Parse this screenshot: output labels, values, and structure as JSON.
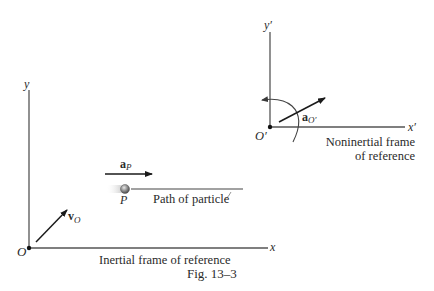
{
  "inertial_frame": {
    "origin_label": "O",
    "x_axis_label": "x",
    "y_axis_label": "y",
    "caption": "Inertial frame of reference",
    "velocity_vector": {
      "symbol": "v",
      "subscript": "O"
    }
  },
  "particle": {
    "label": "P",
    "acceleration_vector": {
      "symbol": "a",
      "subscript": "P"
    },
    "path_label": "Path of particle"
  },
  "noninertial_frame": {
    "origin_label": "O′",
    "x_axis_label": "x′",
    "y_axis_label": "y′",
    "caption_line1": "Noninertial frame",
    "caption_line2": "of reference",
    "acceleration_vector": {
      "symbol": "a",
      "subscript": "O′"
    }
  },
  "figure": {
    "caption": "Fig. 13–3"
  },
  "colors": {
    "line": "#3a3a3a",
    "text": "#2a2a2a",
    "particle_fill": "#9a9a9a"
  }
}
